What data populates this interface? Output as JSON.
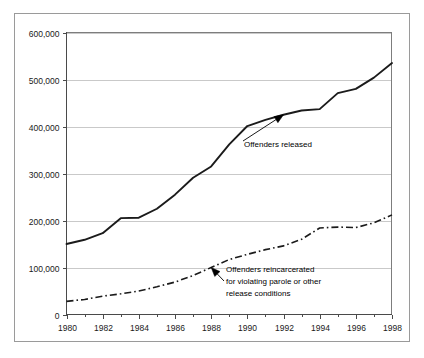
{
  "chart_data": {
    "type": "line",
    "title": "",
    "subtitle": "",
    "xlabel": "",
    "ylabel": "",
    "xlim": [
      1980,
      1998
    ],
    "ylim": [
      0,
      600000
    ],
    "grid": true,
    "legend_position": "none",
    "x": [
      1980,
      1981,
      1982,
      1983,
      1984,
      1985,
      1986,
      1987,
      1988,
      1989,
      1990,
      1991,
      1992,
      1993,
      1994,
      1995,
      1996,
      1997,
      1998
    ],
    "x_tick_labels": [
      "1980",
      "1982",
      "1984",
      "1986",
      "1988",
      "1990",
      "1992",
      "1994",
      "1996",
      "1998"
    ],
    "x_tick_values": [
      1980,
      1982,
      1984,
      1986,
      1988,
      1990,
      1992,
      1994,
      1996,
      1998
    ],
    "x_minor_ticks": [
      1981,
      1983,
      1985,
      1987,
      1989,
      1991,
      1993,
      1995,
      1997
    ],
    "y_tick_labels": [
      "0",
      "100,000",
      "200,000",
      "300,000",
      "400,000",
      "500,000",
      "600,000"
    ],
    "y_tick_values": [
      0,
      100000,
      200000,
      300000,
      400000,
      500000,
      600000
    ],
    "series": [
      {
        "name": "Offenders released",
        "style": "solid",
        "color": "#1b1b1b",
        "values": [
          150000,
          159000,
          173000,
          205000,
          206000,
          225000,
          255000,
          291000,
          315000,
          362000,
          401000,
          414000,
          425000,
          434000,
          437000,
          471000,
          480000,
          504000,
          535000
        ]
      },
      {
        "name": "Offenders reincarcerated for violating parole or other release conditions",
        "style": "dash-dot",
        "color": "#1b1b1b",
        "values": [
          28000,
          32000,
          39000,
          44000,
          50000,
          59000,
          69000,
          83000,
          100000,
          117000,
          128000,
          138000,
          146000,
          160000,
          184000,
          186000,
          185000,
          195000,
          212000
        ]
      }
    ],
    "annotations": [
      {
        "id": "annot-released",
        "text_lines": [
          "Offenders released"
        ],
        "points_to_year": 1992,
        "points_to_value": 425000
      },
      {
        "id": "annot-reincarcerated",
        "text_lines": [
          "Offenders reincarcerated",
          "for violating parole or other",
          "release conditions"
        ],
        "points_to_year": 1988,
        "points_to_value": 100000
      }
    ]
  },
  "colors": {
    "gridline": "#c9c9c9",
    "axis": "#4a4a4a",
    "frame": "#9a9a9a",
    "series": "#1b1b1b",
    "background": "#ffffff"
  }
}
